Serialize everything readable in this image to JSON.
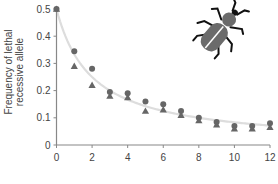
{
  "chart_data": {
    "type": "scatter",
    "title": "",
    "xlabel": "",
    "ylabel": "Frequency of lethal recessive allele",
    "ylabel_lines": [
      "Frequency of lethal",
      "recessive allele"
    ],
    "xlim": [
      0,
      12
    ],
    "ylim": [
      0,
      0.5
    ],
    "x_ticks": [
      0,
      2,
      4,
      6,
      8,
      10,
      12
    ],
    "x_tick_labels": [
      "0",
      "2",
      "4",
      "6",
      "8",
      "10",
      "12"
    ],
    "y_ticks": [
      0,
      0.1,
      0.2,
      0.3,
      0.4,
      0.5
    ],
    "y_tick_labels": [
      "0",
      "0.1",
      "0.2",
      "0.3",
      "0.4",
      "0.5"
    ],
    "grid": false,
    "legend": "none",
    "x": [
      0,
      1,
      2,
      3,
      4,
      5,
      6,
      7,
      8,
      9,
      10,
      11,
      12
    ],
    "series": [
      {
        "name": "circles",
        "marker": "circle",
        "color": "#666666",
        "values": [
          0.5,
          0.345,
          0.28,
          0.195,
          0.19,
          0.16,
          0.15,
          0.125,
          0.1,
          0.085,
          0.07,
          0.07,
          0.08
        ]
      },
      {
        "name": "triangles",
        "marker": "triangle",
        "color": "#666666",
        "values": [
          0.5,
          0.29,
          0.22,
          0.18,
          0.175,
          0.125,
          0.13,
          0.11,
          0.09,
          0.075,
          0.06,
          0.06,
          0.065
        ]
      },
      {
        "name": "theoretical curve",
        "marker": "none",
        "line": true,
        "color": "#dddddd",
        "formula": "q0/(1+t*q0)",
        "values": [
          0.5,
          0.333,
          0.25,
          0.2,
          0.167,
          0.143,
          0.125,
          0.111,
          0.1,
          0.091,
          0.083,
          0.077,
          0.071
        ]
      }
    ],
    "annotations": [
      "beetle-illustration"
    ]
  },
  "colors": {
    "axis": "#888888",
    "marker": "#666666",
    "curve": "#dddddd",
    "beetle_body": "#6b6b6b",
    "beetle_legs": "#111111"
  }
}
